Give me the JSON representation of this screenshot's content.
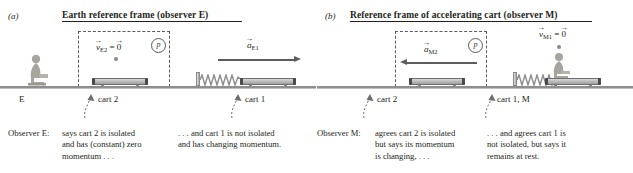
{
  "figure": {
    "panels": [
      {
        "letter": "(a)",
        "title": "Earth reference frame (observer E)",
        "observer_label": "E",
        "vectors": [
          {
            "name": "velocity-cart2",
            "symbol": "v",
            "subscript": "E2",
            "equals": "=",
            "zero": "0",
            "direction": "none"
          },
          {
            "name": "acceleration-cart1",
            "symbol": "a",
            "subscript": "E1",
            "direction": "right"
          }
        ],
        "momentum_marker": "p",
        "tags": [
          "cart 2",
          "cart 1"
        ],
        "caption_who": "Observer E:",
        "caption_left": "says cart 2 is isolated\nand has (constant) zero\nmomentum . . .",
        "caption_right": ". . . and cart 1 is not isolated\nand has changing momentum."
      },
      {
        "letter": "(b)",
        "title": "Reference frame of accelerating cart (observer M)",
        "observer_label": "M",
        "vectors": [
          {
            "name": "acceleration-cart2",
            "symbol": "a",
            "subscript": "M2",
            "direction": "left"
          },
          {
            "name": "velocity-cart1",
            "symbol": "v",
            "subscript": "M1",
            "equals": "=",
            "zero": "0",
            "direction": "none"
          }
        ],
        "momentum_marker": "p",
        "tags": [
          "cart 2",
          "cart 1, M"
        ],
        "caption_who": "Observer M:",
        "caption_left": "agrees cart 2 is isolated\nbut says its momentum\nis changing, . . .",
        "caption_right": ". . . and agrees cart 1 is\nnot isolated, but says it\nremains at rest."
      }
    ],
    "colors": {
      "ink": "#231f20",
      "rule": "#8e8e8e",
      "arrow": "#5d5d5d",
      "dash": "#5a5a5a",
      "cart_body": "#bdbdbd",
      "cart_edge": "#6f6f6f"
    },
    "glyphs": {
      "vector_hat": "→",
      "leader_arrow": "↗"
    }
  }
}
